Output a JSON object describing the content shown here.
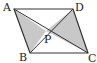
{
  "diagram": {
    "type": "geometry",
    "shape": "parallelogram",
    "vertices": {
      "A": {
        "label": "A",
        "x": 14,
        "y": 9
      },
      "D": {
        "label": "D",
        "x": 73,
        "y": 9
      },
      "B": {
        "label": "B",
        "x": 30,
        "y": 53
      },
      "C": {
        "label": "C",
        "x": 88,
        "y": 53
      }
    },
    "point": {
      "label": "P",
      "x": 46,
      "y": 31
    },
    "shaded_triangles": [
      "APB",
      "PDC"
    ],
    "colors": {
      "line": "#333333",
      "fill": "#c8c8c8",
      "background": "#ffffff"
    }
  }
}
